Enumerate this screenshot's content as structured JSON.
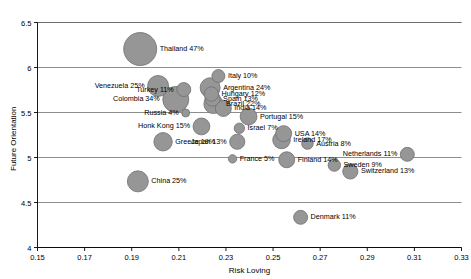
{
  "chart_data": {
    "type": "scatter",
    "title": "",
    "xlabel": "Risk Loving",
    "ylabel": "Future Orientation",
    "xlim": [
      0.15,
      0.33
    ],
    "ylim": [
      4,
      6.5
    ],
    "xticks": [
      "0.15",
      "0.17",
      "0.19",
      "0.21",
      "0.23",
      "0.25",
      "0.27",
      "0.29",
      "0.31",
      "0.33"
    ],
    "xtick_values": [
      0.15,
      0.17,
      0.19,
      0.21,
      0.23,
      0.25,
      0.27,
      0.29,
      0.31,
      0.33
    ],
    "yticks": [
      "4",
      "4.5",
      "5",
      "5.5",
      "6",
      "6.5"
    ],
    "ytick_values": [
      4,
      4.5,
      5,
      5.5,
      6,
      6.5
    ],
    "grid": "horizontal-major",
    "legend": "none",
    "bubble_color": "#969696",
    "bubble_border_color": "#6e6e6e",
    "grid_color": "#808080",
    "size_encoding": "percent",
    "points": [
      {
        "label": "Thailand 47%",
        "name": "Thailand",
        "percent": 47,
        "x": 0.1936,
        "y": 6.205,
        "r": 16.5,
        "label_side": "right"
      },
      {
        "label": "Italy 10%",
        "name": "Italy",
        "percent": 10,
        "x": 0.2268,
        "y": 5.905,
        "r": 6.5,
        "label_side": "right"
      },
      {
        "label": "Venezuela 25%",
        "name": "Venezuela",
        "percent": 25,
        "x": 0.2012,
        "y": 5.795,
        "r": 10.5,
        "label_side": "left"
      },
      {
        "label": "Turkey 11%",
        "name": "Turkey",
        "percent": 11,
        "x": 0.2121,
        "y": 5.755,
        "r": 7.0,
        "label_side": "left"
      },
      {
        "label": "Argentina 24%",
        "name": "Argentina",
        "percent": 24,
        "x": 0.2233,
        "y": 5.775,
        "r": 10.0,
        "label_side": "right"
      },
      {
        "label": "Hungary 12%",
        "name": "Hungary",
        "percent": 12,
        "x": 0.2238,
        "y": 5.705,
        "r": 7.2,
        "label_side": "right"
      },
      {
        "label": "Spain 13%",
        "name": "Spain",
        "percent": 13,
        "x": 0.2243,
        "y": 5.655,
        "r": 7.6,
        "label_side": "right"
      },
      {
        "label": "Brazil 22%",
        "name": "Brazil",
        "percent": 22,
        "x": 0.2247,
        "y": 5.595,
        "r": 9.6,
        "label_side": "right"
      },
      {
        "label": "Colombia 34%",
        "name": "Colombia",
        "percent": 34,
        "x": 0.2087,
        "y": 5.645,
        "r": 13.0,
        "label_side": "left"
      },
      {
        "label": "India 14%",
        "name": "India",
        "percent": 14,
        "x": 0.2289,
        "y": 5.545,
        "r": 8.0,
        "label_side": "right"
      },
      {
        "label": "Russia 4%",
        "name": "Russia",
        "percent": 4,
        "x": 0.2129,
        "y": 5.495,
        "r": 4.0,
        "label_side": "left"
      },
      {
        "label": "Portugal 15%",
        "name": "Portugal",
        "percent": 15,
        "x": 0.2396,
        "y": 5.455,
        "r": 8.4,
        "label_side": "right"
      },
      {
        "label": "Honk Kong 15%",
        "name": "Honk Kong",
        "percent": 15,
        "x": 0.2196,
        "y": 5.345,
        "r": 8.4,
        "label_side": "left"
      },
      {
        "label": "Israel 7%",
        "name": "Israel",
        "percent": 7,
        "x": 0.2357,
        "y": 5.325,
        "r": 5.2,
        "label_side": "right"
      },
      {
        "label": "USA 14%",
        "name": "USA",
        "percent": 14,
        "x": 0.2545,
        "y": 5.265,
        "r": 8.0,
        "label_side": "right"
      },
      {
        "label": "Ireland 17%",
        "name": "Ireland",
        "percent": 17,
        "x": 0.2536,
        "y": 5.195,
        "r": 8.8,
        "label_side": "right"
      },
      {
        "label": "Greece 19%",
        "name": "Greece",
        "percent": 19,
        "x": 0.2033,
        "y": 5.175,
        "r": 9.2,
        "label_side": "right"
      },
      {
        "label": "Japan 13%",
        "name": "Japan",
        "percent": 13,
        "x": 0.2348,
        "y": 5.175,
        "r": 7.6,
        "label_side": "left"
      },
      {
        "label": "Austria 8%",
        "name": "Austria",
        "percent": 8,
        "x": 0.2646,
        "y": 5.155,
        "r": 5.8,
        "label_side": "right"
      },
      {
        "label": "Netherlands 11%",
        "name": "Netherlands",
        "percent": 11,
        "x": 0.307,
        "y": 5.035,
        "r": 7.0,
        "label_side": "left"
      },
      {
        "label": "France 5%",
        "name": "France",
        "percent": 5,
        "x": 0.2328,
        "y": 4.985,
        "r": 4.2,
        "label_side": "right"
      },
      {
        "label": "Finland 14%",
        "name": "Finland",
        "percent": 14,
        "x": 0.2558,
        "y": 4.975,
        "r": 8.0,
        "label_side": "right"
      },
      {
        "label": "Sweden 9%",
        "name": "Sweden",
        "percent": 9,
        "x": 0.276,
        "y": 4.915,
        "r": 6.2,
        "label_side": "right"
      },
      {
        "label": "Switzerland 13%",
        "name": "Switzerland",
        "percent": 13,
        "x": 0.2828,
        "y": 4.845,
        "r": 7.6,
        "label_side": "right"
      },
      {
        "label": "China 25%",
        "name": "China",
        "percent": 25,
        "x": 0.1926,
        "y": 4.735,
        "r": 10.5,
        "label_side": "right"
      },
      {
        "label": "Denmark 11%",
        "name": "Denmark",
        "percent": 11,
        "x": 0.2617,
        "y": 4.335,
        "r": 7.0,
        "label_side": "right"
      }
    ]
  }
}
